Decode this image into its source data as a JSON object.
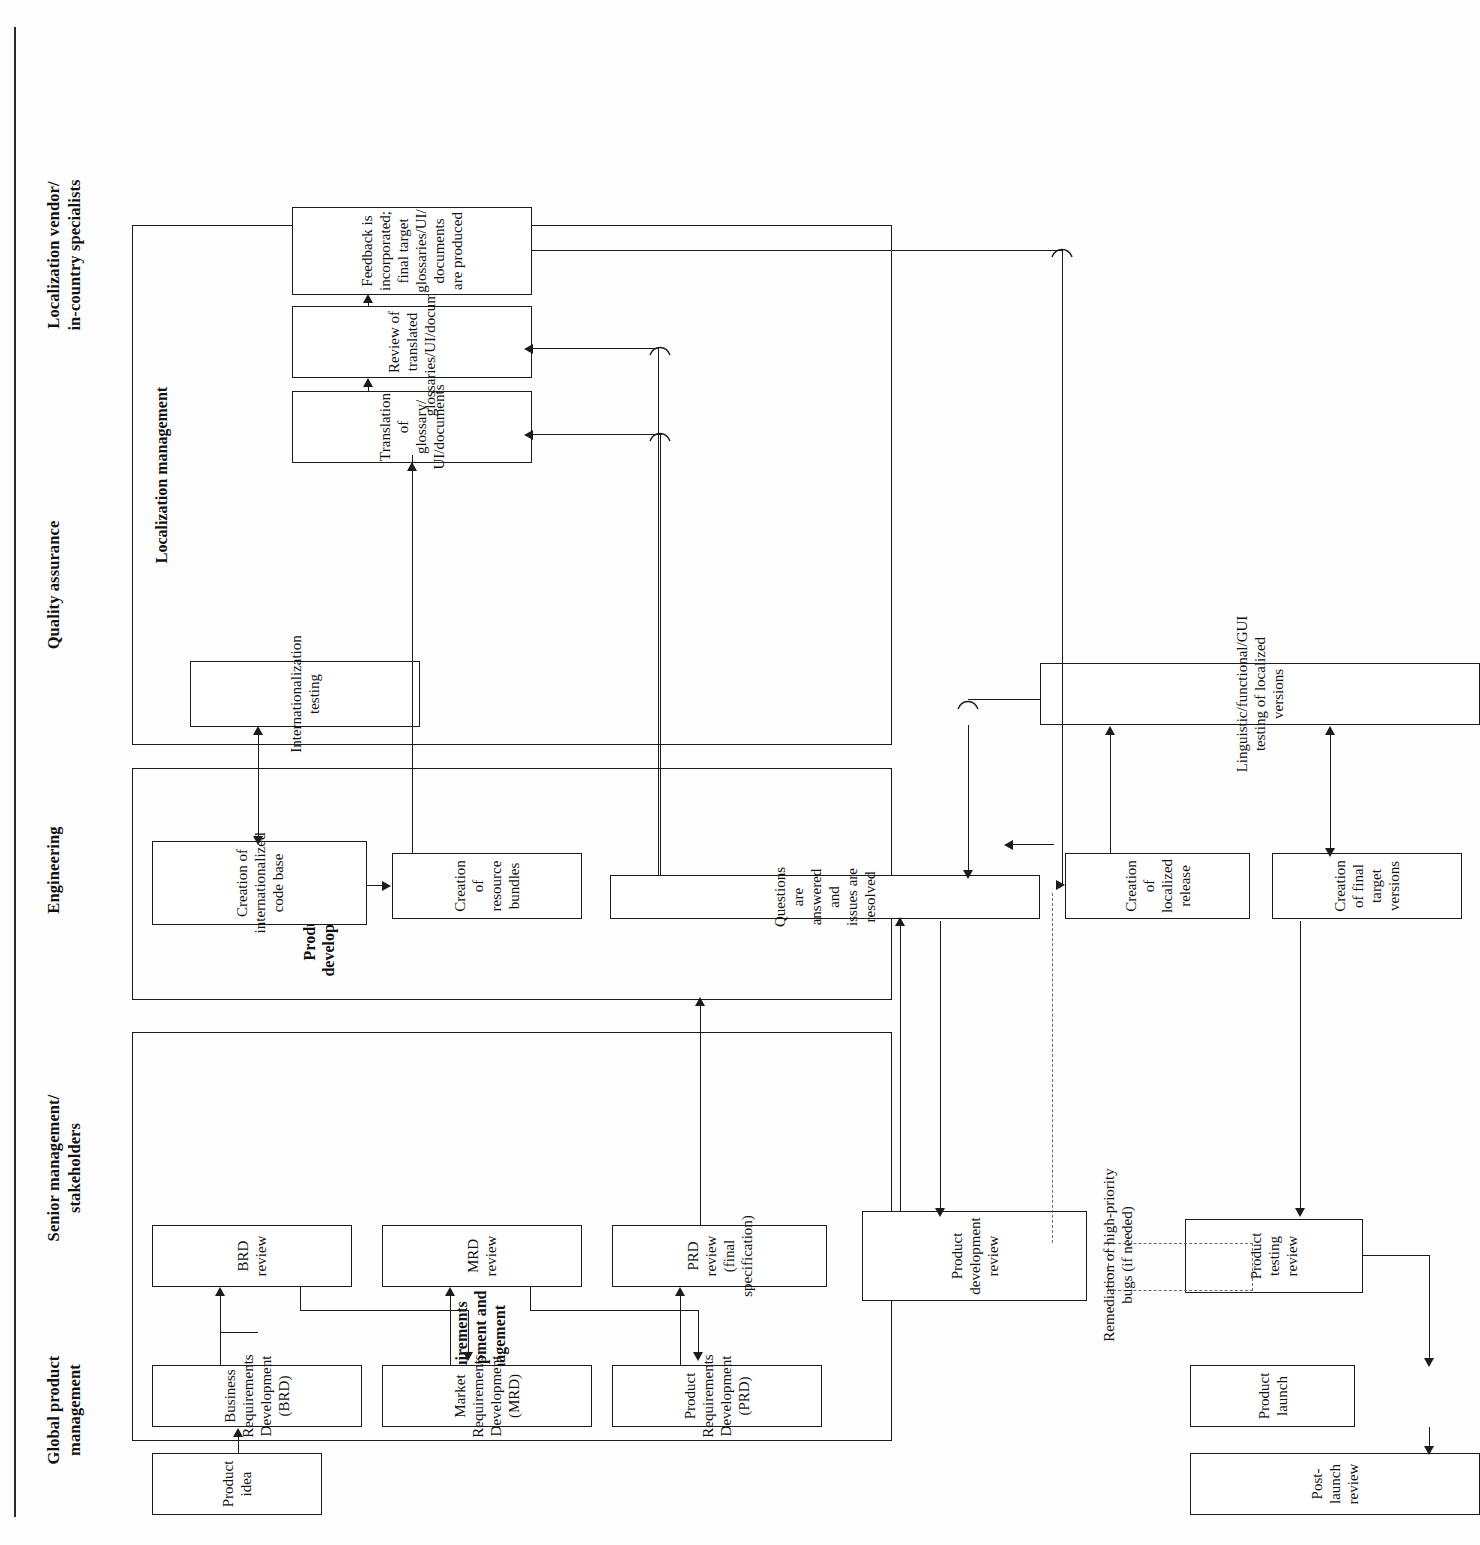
{
  "diagram": {
    "orientation": "rotated-90",
    "lanes": [
      {
        "id": "gpm",
        "label": "Global product\nmanagement"
      },
      {
        "id": "sm",
        "label": "Senior management/\nstakeholders"
      },
      {
        "id": "eng",
        "label": "Engineering"
      },
      {
        "id": "qa",
        "label": "Quality assurance"
      },
      {
        "id": "loc",
        "label": "Localization vendor/\nin-country specialists"
      }
    ],
    "lane_labels": {
      "gpm_line1": "Global product",
      "gpm_line2": "management",
      "sm_line1": "Senior management/",
      "sm_line2": "stakeholders",
      "eng": "Engineering",
      "qa": "Quality assurance",
      "loc_line1": "Localization vendor/",
      "loc_line2": "in-country specialists"
    },
    "groups": [
      {
        "id": "req",
        "label_line1": "Requirements",
        "label_line2": "development and",
        "label_line3": "management"
      },
      {
        "id": "prod",
        "label_line1": "Product",
        "label_line2": "development"
      },
      {
        "id": "locmgmt",
        "label_line1": "Localization management"
      }
    ],
    "group_labels": {
      "requirements": "Requirements development and management",
      "product_development": "Product development",
      "localization_management": "Localization management"
    },
    "nodes": {
      "product_idea": "Product idea",
      "brd": "Business Requirements Development (BRD)",
      "mrd": "Market Requirements Development (MRD)",
      "prd": "Product Requirements Development (PRD)",
      "brd_review": "BRD review",
      "mrd_review": "MRD review",
      "prd_review": "PRD review (final specification)",
      "prod_dev_review": "Product development review",
      "product_testing_review": "Product testing review",
      "product_launch": "Product launch",
      "post_launch_review": "Post-launch review",
      "intl_code_base": "Creation of internationalized code base",
      "resource_bundles": "Creation of resource bundles",
      "questions_resolved": "Questions are answered and issues are resolved",
      "localized_release": "Creation of localized release",
      "final_target_versions": "Creation of final target versions",
      "i18n_testing": "Internationalization testing",
      "ling_func_gui": "Linguistic/functional/GUI testing of localized versions",
      "translation": "Translation of glossary/UI/documents",
      "review_translated": "Review of translated glossaries/UI/documents",
      "feedback_incorporated": "Feedback is incorporated; final target glossaries/UI/documents are produced",
      "remediation": "Remediation of high-priority bugs (if needed)"
    },
    "node_lines": {
      "brd": [
        "Business Requirements",
        "Development (BRD)"
      ],
      "mrd": [
        "Market Requirements",
        "Development (MRD)"
      ],
      "prd": [
        "Product Requirements",
        "Development (PRD)"
      ],
      "prd_review": [
        "PRD review",
        "(final specification)"
      ],
      "prod_dev_review": [
        "Product",
        "development",
        "review"
      ],
      "product_testing_review": [
        "Product testing",
        "review"
      ],
      "intl_code_base": [
        "Creation of",
        "internationalized",
        "code base"
      ],
      "resource_bundles": [
        "Creation of",
        "resource bundles"
      ],
      "localized_release": [
        "Creation of",
        "localized release"
      ],
      "final_target_versions": [
        "Creation of final",
        "target versions"
      ],
      "i18n_testing": [
        "Internationalization",
        "testing"
      ],
      "translation": [
        "Translation of glossary/",
        "UI/documents"
      ],
      "review_translated": [
        "Review of translated",
        "glossaries/UI/documents"
      ],
      "feedback_incorporated": [
        "Feedback is incorporated;",
        "final target glossaries/UI/",
        "documents are produced"
      ],
      "remediation": [
        "Remediation of high-priority",
        "bugs (if needed)"
      ]
    },
    "colors": {
      "stroke": "#1b1b1b",
      "background": "#fdfdfd",
      "box_fill": "#ffffff",
      "dashed_stroke": "#6d6d6d"
    }
  }
}
